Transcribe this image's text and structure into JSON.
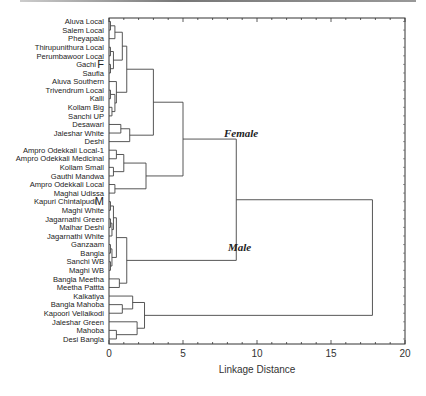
{
  "chart_data": {
    "type": "dendrogram",
    "title": "",
    "xlabel": "Linkage Distance",
    "ylabel": "",
    "xlim": [
      0,
      20
    ],
    "xticks": [
      "0",
      "5",
      "10",
      "15",
      "20"
    ],
    "grid": false,
    "leaves": [
      "Aluva Local",
      "Salem Local",
      "Pheyapala",
      "Thirupunithura Local",
      "Perumbawoor Local",
      "Gachi",
      "Saufia",
      "Aluva Southern",
      "Trivendrum Local",
      "Kalli",
      "Kollam Big",
      "Sanchi UP",
      "Desawari",
      "Jaleshar White",
      "Deshi",
      "Ampro Odekkali Local-1",
      "Ampro Odekkali Medicinal",
      "Kollam Small",
      "Gauthi Mandwa",
      "Ampro Odekkali Local",
      "Maghai Udissa",
      "Kapuri Chintalpudi",
      "Maghi White",
      "Jagarnathi Green",
      "Malhar Deshi",
      "Jagarnathi White",
      "Ganzaam",
      "Bangla",
      "Sanchi WB",
      "Maghi WB",
      "Bangla Meetha",
      "Meetha Pattta",
      "Kalkatiya",
      "Bangla Mahoba",
      "Kapoori Vellaikodi",
      "Jaleshar Green",
      "Mahoba",
      "Desi Bangla"
    ],
    "markers": [
      {
        "leaf": "Gachi",
        "text": "F"
      },
      {
        "leaf": "Kapuri Chintalpudi",
        "text": "M"
      }
    ],
    "annotations": [
      {
        "text": "Female",
        "x": 6.5,
        "near_leaf": "Deshi"
      },
      {
        "text": "Male",
        "x": 6.8,
        "near_leaf": "Ganzaam"
      }
    ],
    "merges": [
      {
        "children": [
          "Aluva Local",
          "Salem Local"
        ],
        "distance": 0.1
      },
      {
        "children": [
          "Thirupunithura Local",
          "Perumbawoor Local"
        ],
        "distance": 0.1
      },
      {
        "children": [
          "(Aluva Local,Salem Local)",
          "Pheyapala"
        ],
        "distance": 0.4
      },
      {
        "children": [
          "(Thirupunithura,Perumbawoor)",
          "Gachi/Saufia"
        ],
        "distance": 0.3
      },
      {
        "children": [
          "top-left cluster A",
          "top-left cluster B"
        ],
        "distance": 0.9
      },
      {
        "children": [
          "Trivendrum Local",
          "Kalli",
          "Kollam Big",
          "Sanchi UP"
        ],
        "distance": 0.4
      },
      {
        "children": [
          "cluster A+B",
          "Aluva Southern group"
        ],
        "distance": 1.2
      },
      {
        "children": [
          "Desawari",
          "Jaleshar White"
        ],
        "distance": 0.8
      },
      {
        "children": [
          "(Desawari,Jaleshar White)",
          "Deshi"
        ],
        "distance": 1.4
      },
      {
        "children": [
          "top cluster",
          "Desawari group"
        ],
        "distance": 3.0
      },
      {
        "children": [
          "Ampro Odekkali Local-1",
          "Ampro Odekkali Medicinal"
        ],
        "distance": 0.5
      },
      {
        "children": [
          "Kollam Small",
          "Gauthi Mandwa"
        ],
        "distance": 0.3
      },
      {
        "children": [
          "Ampro group",
          "Kollam Small group"
        ],
        "distance": 1.0
      },
      {
        "children": [
          "Ampro Odekkali Local",
          "Maghai Udissa"
        ],
        "distance": 0.4
      },
      {
        "children": [
          "Ampro cluster",
          "Ampro Local group"
        ],
        "distance": 2.5
      },
      {
        "children": [
          "Female upper",
          "Female lower"
        ],
        "distance": 5.0
      },
      {
        "children": [
          "Kapuri..Maghi WB (tight cluster)"
        ],
        "distance": 0.5
      },
      {
        "children": [
          "Bangla Meetha",
          "Meetha Pattta"
        ],
        "distance": 0.7
      },
      {
        "children": [
          "Male tight cluster",
          "Bangla Meetha group"
        ],
        "distance": 1.2
      },
      {
        "children": [
          "Female",
          "Male"
        ],
        "distance": 8.6
      },
      {
        "children": [
          "Bangla Mahoba",
          "Kapoori Vellaikodi"
        ],
        "distance": 0.9
      },
      {
        "children": [
          "Kalkatiya",
          "(Bangla Mahoba,Kapoori Vellaikodi)"
        ],
        "distance": 1.6
      },
      {
        "children": [
          "Mahoba",
          "Desi Bangla"
        ],
        "distance": 0.5
      },
      {
        "children": [
          "Jaleshar Green",
          "(Mahoba,Desi Bangla)"
        ],
        "distance": 1.9
      },
      {
        "children": [
          "Kalkatiya group",
          "Jaleshar Green group"
        ],
        "distance": 2.4
      },
      {
        "children": [
          "Female+Male",
          "Bottom cluster"
        ],
        "distance": 17.8
      }
    ]
  }
}
